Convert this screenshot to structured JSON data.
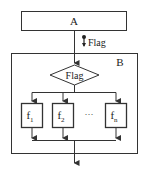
{
  "diagram": {
    "block_a": {
      "label": "A"
    },
    "signal": {
      "label": "Flag"
    },
    "block_b": {
      "label": "B"
    },
    "decision": {
      "label": "Flag"
    },
    "functions": [
      {
        "label": "f",
        "subscript": "1"
      },
      {
        "label": "f",
        "subscript": "2"
      },
      {
        "label": "f",
        "subscript": "n"
      }
    ],
    "ellipsis": "···",
    "colors": {
      "stroke": "#333333",
      "background": "#ffffff"
    }
  }
}
